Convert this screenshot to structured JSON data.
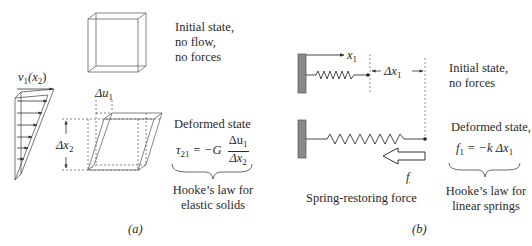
{
  "figure": {
    "panel_a": {
      "label": "(a)",
      "initial_state": [
        "Initial state,",
        "no flow,",
        "no forces"
      ],
      "velocity_label": "v",
      "velocity_sub": "1",
      "velocity_arg": "(x",
      "velocity_arg_sub": "2",
      "velocity_close": ")",
      "delta_u_label": "Δu",
      "delta_u_sub": "1",
      "delta_x_label": "Δx",
      "delta_x_sub": "2",
      "deformed_state": "Deformed state",
      "equation": {
        "lhs": "τ",
        "lhs_sub": "21",
        "mid": " = −G",
        "num": "Δu",
        "num_sub": "1",
        "den": "Δx",
        "den_sub": "2"
      },
      "law": [
        "Hooke’s law for",
        "elastic solids"
      ]
    },
    "panel_b": {
      "label": "(b)",
      "x_axis_label": "x",
      "x_axis_sub": "1",
      "delta_x_label": "Δx",
      "delta_x_sub": "1",
      "initial_state": [
        "Initial state,",
        "no forces"
      ],
      "deformed_state": "Deformed state,",
      "equation": {
        "lhs": "f",
        "lhs_sub": "1",
        "rhs": " = −k Δx",
        "rhs_sub": "1"
      },
      "force_symbol": "f",
      "force_caption": "Spring-restoring force",
      "law": [
        "Hooke’s law for",
        "linear springs"
      ]
    }
  }
}
